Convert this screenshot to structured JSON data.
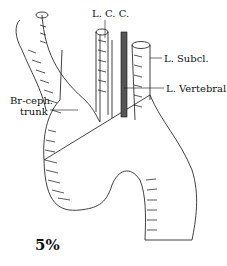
{
  "figure": {
    "labels": {
      "lcc": "L. C. C.",
      "subcl": "L. Subcl.",
      "vertebral": "L. Vertebral",
      "brceph_1": "Br-ceph.",
      "brceph_2": "trunk"
    },
    "frequency": "5%",
    "colors": {
      "ink": "#111111",
      "background": "#ffffff",
      "vertebral_fill": "#555555"
    }
  }
}
